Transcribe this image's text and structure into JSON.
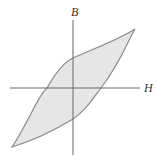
{
  "diagram": {
    "type": "hysteresis-loop",
    "axes": {
      "x_label": "H",
      "y_label": "B"
    },
    "colors": {
      "loop_fill": "#e6e6e6",
      "loop_stroke": "#8a8a8a",
      "axis": "#666666",
      "label": "#333333"
    }
  }
}
